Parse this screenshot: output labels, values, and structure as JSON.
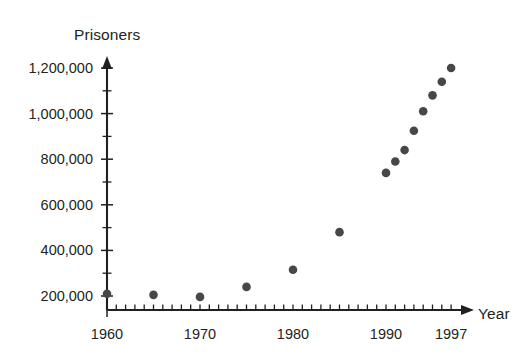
{
  "chart_data": {
    "type": "scatter",
    "title": "",
    "xlabel": "Year",
    "ylabel": "Prisoners",
    "xlim": [
      1959,
      2000
    ],
    "ylim": [
      100000,
      1250000
    ],
    "grid": false,
    "legend": null,
    "x_tick_labels": [
      "1960",
      "1970",
      "1980",
      "1990",
      "1997"
    ],
    "x_tick_values": [
      1960,
      1970,
      1980,
      1990,
      1997
    ],
    "x_minor_tick_step": 1,
    "y_tick_labels": [
      "200,000",
      "400,000",
      "600,000",
      "800,000",
      "1,000,000",
      "1,200,000"
    ],
    "y_tick_values": [
      200000,
      400000,
      600000,
      800000,
      1000000,
      1200000
    ],
    "y_minor_tick_step": 100000,
    "marker": "filled-circle",
    "marker_color": "#474747",
    "axis_color": "#231f20",
    "x": [
      1960,
      1965,
      1970,
      1975,
      1980,
      1985,
      1990,
      1991,
      1992,
      1993,
      1994,
      1995,
      1996,
      1997
    ],
    "y": [
      210000,
      205000,
      196000,
      240000,
      315000,
      480000,
      740000,
      790000,
      840000,
      925000,
      1010000,
      1080000,
      1140000,
      1200000
    ],
    "points": [
      {
        "year": 1960,
        "prisoners": 210000
      },
      {
        "year": 1965,
        "prisoners": 205000
      },
      {
        "year": 1970,
        "prisoners": 196000
      },
      {
        "year": 1975,
        "prisoners": 240000
      },
      {
        "year": 1980,
        "prisoners": 315000
      },
      {
        "year": 1985,
        "prisoners": 480000
      },
      {
        "year": 1990,
        "prisoners": 740000
      },
      {
        "year": 1991,
        "prisoners": 790000
      },
      {
        "year": 1992,
        "prisoners": 840000
      },
      {
        "year": 1993,
        "prisoners": 925000
      },
      {
        "year": 1994,
        "prisoners": 1010000
      },
      {
        "year": 1995,
        "prisoners": 1080000
      },
      {
        "year": 1996,
        "prisoners": 1140000
      },
      {
        "year": 1997,
        "prisoners": 1200000
      }
    ]
  },
  "axes": {
    "y_title": "Prisoners",
    "x_title": "Year"
  }
}
